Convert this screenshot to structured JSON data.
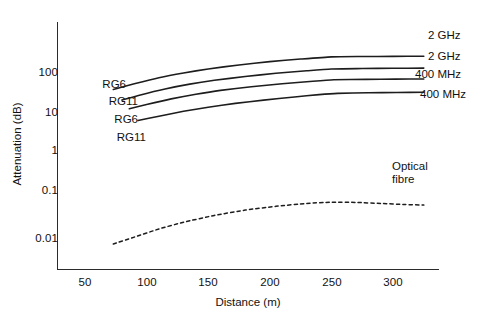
{
  "chart_data": {
    "type": "line",
    "title": "",
    "xlabel": "Distance (m)",
    "ylabel": "Attenuation (dB)",
    "xlim": [
      28,
      338
    ],
    "ylim": [
      0.0025,
      1000
    ],
    "yscale": "log",
    "xscale": "linear",
    "grid": false,
    "legend_position": "inline-right",
    "xticks": [
      50,
      100,
      150,
      200,
      250,
      300
    ],
    "xtick_labels": [
      "50",
      "100",
      "150",
      "200",
      "250",
      "300"
    ],
    "yticks": [
      100,
      10,
      1,
      0.1,
      0.01
    ],
    "ytick_labels": [
      "100",
      "10",
      "1",
      "0.1",
      "0.01"
    ],
    "series": [
      {
        "name": "RG6 2 GHz",
        "left_label": "RG6",
        "right_label": "2 GHz",
        "style": "solid",
        "x": [
          73,
          90,
          110,
          130,
          150,
          175,
          200,
          225,
          250,
          275,
          300,
          325
        ],
        "y": [
          38,
          52,
          73,
          95,
          118,
          148,
          178,
          205,
          232,
          236,
          238,
          240
        ]
      },
      {
        "name": "RG11 2 GHz",
        "left_label": "RG11",
        "right_label": "2 GHz",
        "style": "solid",
        "x": [
          80,
          95,
          115,
          135,
          155,
          180,
          205,
          230,
          250,
          275,
          300,
          325
        ],
        "y": [
          21,
          28,
          39,
          51,
          63,
          78,
          93,
          107,
          118,
          121,
          123,
          124
        ]
      },
      {
        "name": "RG6 400 MHz",
        "left_label": "RG6",
        "right_label": "400 MHz",
        "style": "solid",
        "x": [
          86,
          100,
          120,
          140,
          160,
          185,
          210,
          235,
          252,
          278,
          302,
          325
        ],
        "y": [
          13,
          16.5,
          22.5,
          29,
          36,
          44,
          52,
          60,
          65,
          66.5,
          67.5,
          68
        ]
      },
      {
        "name": "RG11 400 MHz",
        "left_label": "RG11",
        "right_label": "400 MHz",
        "style": "solid",
        "x": [
          93,
          110,
          130,
          150,
          172,
          195,
          220,
          240,
          255,
          280,
          303,
          325
        ],
        "y": [
          6.8,
          8.6,
          11.3,
          14.2,
          17.5,
          21,
          25,
          28.5,
          30.5,
          31.5,
          32,
          32.5
        ]
      },
      {
        "name": "Optical fibre",
        "left_label": "",
        "right_label": "Optical fibre",
        "style": "dashed",
        "x": [
          73,
          90,
          110,
          130,
          155,
          180,
          205,
          230,
          250,
          270,
          290,
          310,
          325
        ],
        "y": [
          0.0072,
          0.0105,
          0.0165,
          0.024,
          0.035,
          0.047,
          0.058,
          0.068,
          0.073,
          0.072,
          0.068,
          0.064,
          0.062
        ]
      }
    ],
    "annotations": [
      {
        "text": "Optical",
        "x": 318,
        "y": 0.35
      },
      {
        "text": "fibre",
        "x": 318,
        "y": 0.23
      }
    ]
  },
  "labels": {
    "y_axis_title": "Attenuation (dB)",
    "x_axis_title": "Distance (m)",
    "ytick_100": "100",
    "ytick_10": "10",
    "ytick_1": "1",
    "ytick_0_1": "0.1",
    "ytick_0_01": "0.01",
    "xtick_50": "50",
    "xtick_100": "100",
    "xtick_150": "150",
    "xtick_200": "200",
    "xtick_250": "250",
    "xtick_300": "300",
    "left_rg6_top": "RG6",
    "left_rg11_upper": "RG11",
    "left_rg6_lower": "RG6",
    "left_rg11_bottom": "RG11",
    "right_2ghz_top": "2 GHz",
    "right_2ghz_second": "2 GHz",
    "right_400mhz_third": "400 MHz",
    "right_400mhz_bottom": "400 MHz",
    "optical_line1": "Optical",
    "optical_line2": "fibre"
  },
  "colors": {
    "line": "#1d1d1d",
    "axis": "#2b2b2b",
    "text": "#111111",
    "background": "#ffffff"
  }
}
